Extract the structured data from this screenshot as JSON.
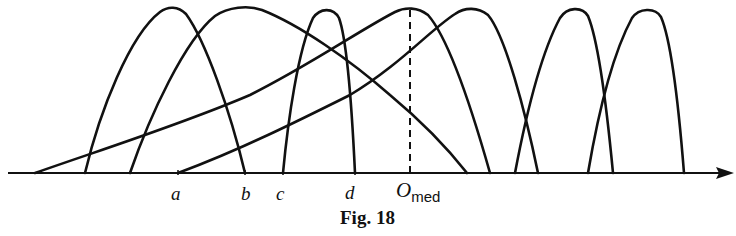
{
  "figure": {
    "caption": "Fig. 18",
    "axis_labels": {
      "a": "a",
      "b": "b",
      "c": "c",
      "d": "d",
      "o_main": "O",
      "o_sub": "med"
    },
    "curves": [
      {
        "id": 1,
        "start_x": 85,
        "peak": [
          173,
          8
        ],
        "end_x": 245
      },
      {
        "id": 2,
        "start_x": 130,
        "peak": [
          240,
          8
        ],
        "end_x": 467
      },
      {
        "id": 3,
        "start_x": 283,
        "peak": [
          327,
          10
        ],
        "end_x": 355
      },
      {
        "id": 4,
        "start_x": 35,
        "peak": [
          410,
          9
        ],
        "end_x": 490
      },
      {
        "id": 5,
        "start_x": 178,
        "peak": [
          470,
          9
        ],
        "end_x": 538
      },
      {
        "id": 6,
        "start_x": 515,
        "peak": [
          575,
          9
        ],
        "end_x": 613
      },
      {
        "id": 7,
        "start_x": 588,
        "peak": [
          648,
          10
        ],
        "end_x": 684
      }
    ],
    "median_line_x": 410
  }
}
